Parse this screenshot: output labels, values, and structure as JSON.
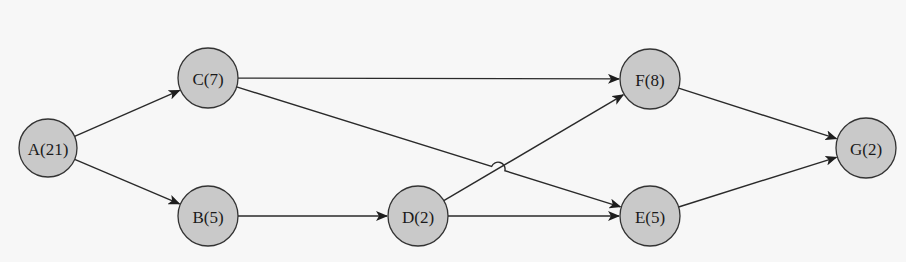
{
  "diagram": {
    "type": "activity-on-node network",
    "background": "#f7f7f7",
    "node_fill": "#c9c9c9",
    "stroke": "#333333",
    "nodes": [
      {
        "id": "A",
        "label": "A(21)",
        "duration": 21,
        "cx": 48,
        "cy": 148,
        "r": 29
      },
      {
        "id": "C",
        "label": "C(7)",
        "duration": 7,
        "cx": 208,
        "cy": 78,
        "r": 30
      },
      {
        "id": "B",
        "label": "B(5)",
        "duration": 5,
        "cx": 208,
        "cy": 216,
        "r": 30
      },
      {
        "id": "D",
        "label": "D(2)",
        "duration": 2,
        "cx": 418,
        "cy": 216,
        "r": 30
      },
      {
        "id": "F",
        "label": "F(8)",
        "duration": 8,
        "cx": 650,
        "cy": 79,
        "r": 30
      },
      {
        "id": "E",
        "label": "E(5)",
        "duration": 5,
        "cx": 650,
        "cy": 216,
        "r": 30
      },
      {
        "id": "G",
        "label": "G(2)",
        "duration": 2,
        "cx": 866,
        "cy": 148,
        "r": 30
      }
    ],
    "edges": [
      {
        "from": "A",
        "to": "C"
      },
      {
        "from": "A",
        "to": "B"
      },
      {
        "from": "C",
        "to": "F"
      },
      {
        "from": "C",
        "to": "E",
        "hop_over": "D->F"
      },
      {
        "from": "B",
        "to": "D"
      },
      {
        "from": "D",
        "to": "F"
      },
      {
        "from": "D",
        "to": "E"
      },
      {
        "from": "F",
        "to": "G"
      },
      {
        "from": "E",
        "to": "G"
      }
    ]
  }
}
